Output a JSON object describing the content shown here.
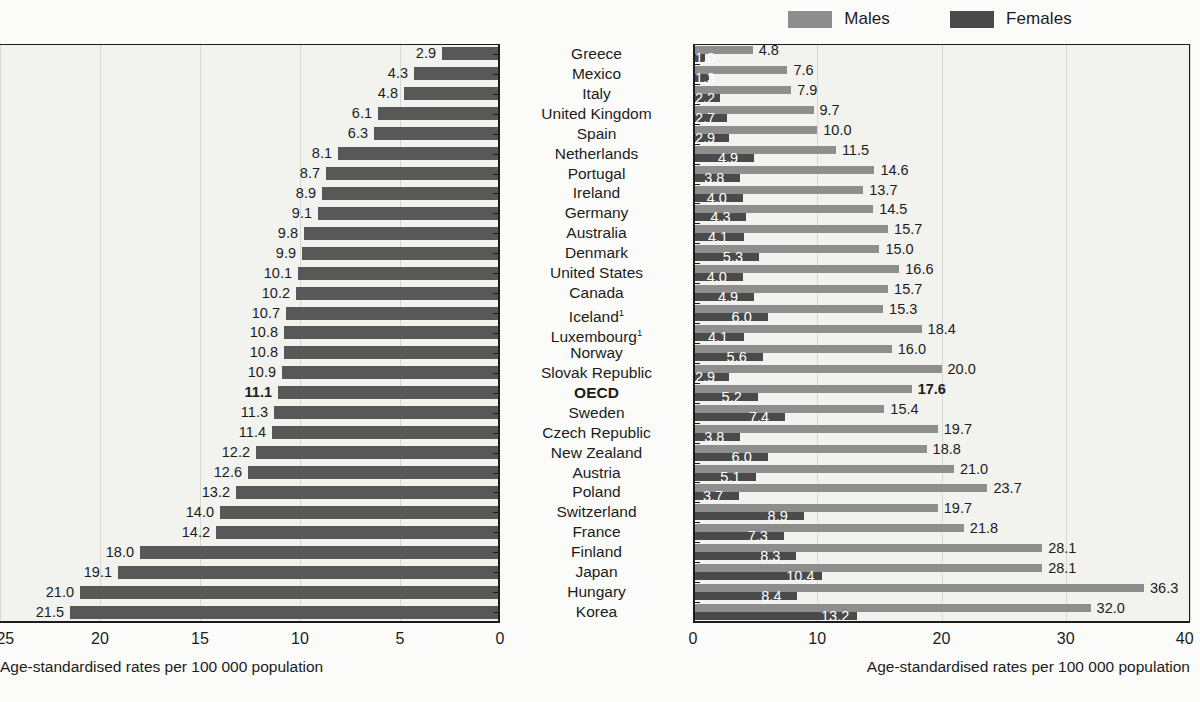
{
  "legend": {
    "items": [
      {
        "label": "Males",
        "color": "#8e8e8e",
        "name": "males"
      },
      {
        "label": "Females",
        "color": "#4a4a4a",
        "name": "females"
      }
    ]
  },
  "left_axis": {
    "caption": "Age-standardised rates per 100 000 population",
    "ticks": [
      "25",
      "20",
      "15",
      "10",
      "5",
      "0"
    ],
    "min": 0,
    "max": 25,
    "reversed": true
  },
  "right_axis": {
    "caption": "Age-standardised rates per 100 000 population",
    "ticks": [
      "0",
      "10",
      "20",
      "30",
      "40"
    ],
    "min": 0,
    "max": 40,
    "reversed": false
  },
  "chart_data": {
    "type": "bar",
    "title": "",
    "subtitle": "",
    "xlabel": "Age-standardised rates per 100 000 population",
    "ylabel": "",
    "orientation": "horizontal",
    "layout": "back-to-back butterfly; left panel total rate (axis reversed 25 to 0), right panel Males and Females grouped (axis 0 to 40)",
    "legend_position": "top-center-right",
    "grid": true,
    "left_panel": {
      "name": "Total",
      "xlim": [
        0,
        25
      ],
      "reversed": true,
      "color": "#585858",
      "value_format": "one decimal"
    },
    "right_panel": {
      "xlim": [
        0,
        40
      ],
      "reversed": false,
      "series": [
        {
          "name": "Males",
          "color": "#8e8e8e"
        },
        {
          "name": "Females",
          "color": "#4a4a4a"
        }
      ]
    },
    "categories": [
      "Greece",
      "Mexico",
      "Italy",
      "United Kingdom",
      "Spain",
      "Netherlands",
      "Portugal",
      "Ireland",
      "Germany",
      "Australia",
      "Denmark",
      "United States",
      "Canada",
      "Iceland",
      "Luxembourg",
      "Norway",
      "Slovak Republic",
      "OECD",
      "Sweden",
      "Czech Republic",
      "New Zealand",
      "Austria",
      "Poland",
      "Switzerland",
      "France",
      "Finland",
      "Japan",
      "Hungary",
      "Korea"
    ],
    "total": [
      2.9,
      4.3,
      4.8,
      6.1,
      6.3,
      8.1,
      8.7,
      8.9,
      9.1,
      9.8,
      9.9,
      10.1,
      10.2,
      10.7,
      10.8,
      10.8,
      10.9,
      11.1,
      11.3,
      11.4,
      12.2,
      12.6,
      13.2,
      14.0,
      14.2,
      18.0,
      19.1,
      21.0,
      21.5
    ],
    "males": [
      4.8,
      7.6,
      7.9,
      9.7,
      10.0,
      11.5,
      14.6,
      13.7,
      14.5,
      15.7,
      15.0,
      16.6,
      15.7,
      15.3,
      18.4,
      16.0,
      20.0,
      17.6,
      15.4,
      19.7,
      18.8,
      21.0,
      23.7,
      19.7,
      21.8,
      28.1,
      28.1,
      36.3,
      32.0
    ],
    "females": [
      1.0,
      1.3,
      2.2,
      2.7,
      2.9,
      4.9,
      3.8,
      4.0,
      4.3,
      4.1,
      5.3,
      4.0,
      4.9,
      6.0,
      4.1,
      5.6,
      2.9,
      5.2,
      7.4,
      3.8,
      6.0,
      5.1,
      3.7,
      8.9,
      7.3,
      8.3,
      10.4,
      8.4,
      13.2
    ]
  },
  "rows": [
    {
      "country": "Greece",
      "footnote": "",
      "highlight": false,
      "total": "2.9",
      "males": "4.8",
      "females": "1.0"
    },
    {
      "country": "Mexico",
      "footnote": "",
      "highlight": false,
      "total": "4.3",
      "males": "7.6",
      "females": "1.3"
    },
    {
      "country": "Italy",
      "footnote": "",
      "highlight": false,
      "total": "4.8",
      "males": "7.9",
      "females": "2.2"
    },
    {
      "country": "United Kingdom",
      "footnote": "",
      "highlight": false,
      "total": "6.1",
      "males": "9.7",
      "females": "2.7"
    },
    {
      "country": "Spain",
      "footnote": "",
      "highlight": false,
      "total": "6.3",
      "males": "10.0",
      "females": "2.9"
    },
    {
      "country": "Netherlands",
      "footnote": "",
      "highlight": false,
      "total": "8.1",
      "males": "11.5",
      "females": "4.9"
    },
    {
      "country": "Portugal",
      "footnote": "",
      "highlight": false,
      "total": "8.7",
      "males": "14.6",
      "females": "3.8"
    },
    {
      "country": "Ireland",
      "footnote": "",
      "highlight": false,
      "total": "8.9",
      "males": "13.7",
      "females": "4.0"
    },
    {
      "country": "Germany",
      "footnote": "",
      "highlight": false,
      "total": "9.1",
      "males": "14.5",
      "females": "4.3"
    },
    {
      "country": "Australia",
      "footnote": "",
      "highlight": false,
      "total": "9.8",
      "males": "15.7",
      "females": "4.1"
    },
    {
      "country": "Denmark",
      "footnote": "",
      "highlight": false,
      "total": "9.9",
      "males": "15.0",
      "females": "5.3"
    },
    {
      "country": "United States",
      "footnote": "",
      "highlight": false,
      "total": "10.1",
      "males": "16.6",
      "females": "4.0"
    },
    {
      "country": "Canada",
      "footnote": "",
      "highlight": false,
      "total": "10.2",
      "males": "15.7",
      "females": "4.9"
    },
    {
      "country": "Iceland",
      "footnote": "1",
      "highlight": false,
      "total": "10.7",
      "males": "15.3",
      "females": "6.0"
    },
    {
      "country": "Luxembourg",
      "footnote": "1",
      "highlight": false,
      "total": "10.8",
      "males": "18.4",
      "females": "4.1"
    },
    {
      "country": "Norway",
      "footnote": "",
      "highlight": false,
      "total": "10.8",
      "males": "16.0",
      "females": "5.6"
    },
    {
      "country": "Slovak Republic",
      "footnote": "",
      "highlight": false,
      "total": "10.9",
      "males": "20.0",
      "females": "2.9"
    },
    {
      "country": "OECD",
      "footnote": "",
      "highlight": true,
      "total": "11.1",
      "males": "17.6",
      "females": "5.2"
    },
    {
      "country": "Sweden",
      "footnote": "",
      "highlight": false,
      "total": "11.3",
      "males": "15.4",
      "females": "7.4"
    },
    {
      "country": "Czech Republic",
      "footnote": "",
      "highlight": false,
      "total": "11.4",
      "males": "19.7",
      "females": "3.8"
    },
    {
      "country": "New Zealand",
      "footnote": "",
      "highlight": false,
      "total": "12.2",
      "males": "18.8",
      "females": "6.0"
    },
    {
      "country": "Austria",
      "footnote": "",
      "highlight": false,
      "total": "12.6",
      "males": "21.0",
      "females": "5.1"
    },
    {
      "country": "Poland",
      "footnote": "",
      "highlight": false,
      "total": "13.2",
      "males": "23.7",
      "females": "3.7"
    },
    {
      "country": "Switzerland",
      "footnote": "",
      "highlight": false,
      "total": "14.0",
      "males": "19.7",
      "females": "8.9"
    },
    {
      "country": "France",
      "footnote": "",
      "highlight": false,
      "total": "14.2",
      "males": "21.8",
      "females": "7.3"
    },
    {
      "country": "Finland",
      "footnote": "",
      "highlight": false,
      "total": "18.0",
      "males": "28.1",
      "females": "8.3"
    },
    {
      "country": "Japan",
      "footnote": "",
      "highlight": false,
      "total": "19.1",
      "males": "28.1",
      "females": "10.4"
    },
    {
      "country": "Hungary",
      "footnote": "",
      "highlight": false,
      "total": "21.0",
      "males": "36.3",
      "females": "8.4"
    },
    {
      "country": "Korea",
      "footnote": "",
      "highlight": false,
      "total": "21.5",
      "males": "32.0",
      "females": "13.2"
    }
  ]
}
